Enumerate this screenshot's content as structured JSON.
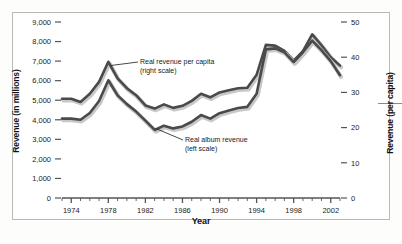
{
  "chart_data": {
    "type": "line",
    "title": "",
    "xlabel": "Year",
    "ylabel": "Revenue (in millions)",
    "ylabel_right": "Revenue (per capita)",
    "grid": false,
    "legend_position": "inline-annotations",
    "xlim": [
      1973,
      2003
    ],
    "ylim": [
      0,
      9000
    ],
    "ylim_right": [
      0,
      50
    ],
    "ytick_labels": [
      "0",
      "1,000",
      "2,000",
      "3,000",
      "4,000",
      "5,000",
      "6,000",
      "7,000",
      "8,000",
      "9,000"
    ],
    "ytick_values": [
      0,
      1000,
      2000,
      3000,
      4000,
      5000,
      6000,
      7000,
      8000,
      9000
    ],
    "ytick_right_labels": [
      "0",
      "10",
      "20",
      "30",
      "40",
      "50"
    ],
    "ytick_right_values": [
      0,
      10,
      20,
      30,
      40,
      50
    ],
    "xtick_labels": [
      "1974",
      "1978",
      "1982",
      "1986",
      "1990",
      "1994",
      "1998",
      "2002"
    ],
    "xtick_values": [
      1974,
      1978,
      1982,
      1986,
      1990,
      1994,
      1998,
      2002
    ],
    "x": [
      1973,
      1974,
      1975,
      1976,
      1977,
      1978,
      1979,
      1980,
      1981,
      1982,
      1983,
      1984,
      1985,
      1986,
      1987,
      1988,
      1989,
      1990,
      1991,
      1992,
      1993,
      1994,
      1995,
      1996,
      1997,
      1998,
      1999,
      2000,
      2001,
      2002,
      2003
    ],
    "series": [
      {
        "name": "Real revenue per capita (right scale)",
        "scale": "right",
        "color": "#4a4a4a",
        "values": [
          28.2,
          28.2,
          27.3,
          29.6,
          33.0,
          38.7,
          34.0,
          31.2,
          29.2,
          26.3,
          25.4,
          26.6,
          25.6,
          26.2,
          27.6,
          29.6,
          28.6,
          30.0,
          30.6,
          31.2,
          31.3,
          35.0,
          43.5,
          43.3,
          41.8,
          39.0,
          41.7,
          46.5,
          43.4,
          40.0,
          37.6
        ]
      },
      {
        "name": "Real album revenue (left scale)",
        "scale": "left",
        "color": "#4a4a4a",
        "values": [
          4060,
          4060,
          4000,
          4350,
          4960,
          6020,
          5250,
          4800,
          4420,
          3960,
          3480,
          3700,
          3560,
          3660,
          3900,
          4240,
          4060,
          4340,
          4480,
          4600,
          4660,
          5330,
          7600,
          7650,
          7450,
          6950,
          7450,
          8050,
          7560,
          7000,
          6280
        ]
      }
    ],
    "annotations": [
      {
        "id": "annot-upper",
        "line1": "Real revenue per capita",
        "line2": "(right scale)",
        "points_to": "upper-line"
      },
      {
        "id": "annot-lower",
        "line1": "Real album revenue",
        "line2": "(left scale)",
        "points_to": "lower-line"
      }
    ]
  },
  "figure": {
    "background_color": "#ffffff",
    "frame_color": "#b9b9b9",
    "line_color": "#4a4a4a",
    "shadow_color": "#c8c8c8",
    "axis_color": "#555555",
    "text_color": "#1a1a1a"
  }
}
